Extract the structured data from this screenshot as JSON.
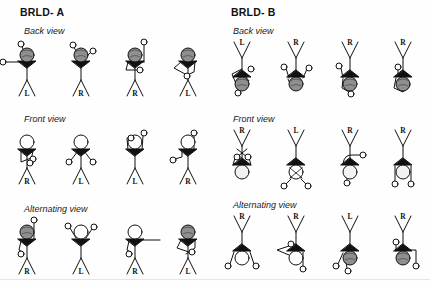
{
  "figure": {
    "background_color": "#ffffff",
    "ink_color": "#111111",
    "head_shaded_color": "#8a8a8a",
    "head_plain_color": "#ffffff"
  },
  "panels": [
    {
      "id": "brld-a",
      "title": "BRLD- A",
      "orientation": "upright",
      "rows": [
        {
          "id": "back-view",
          "label": "Back view",
          "figures": [
            {
              "leg_label": "L",
              "head": "shaded",
              "pose": "left-arm-extended-horizontal"
            },
            {
              "leg_label": "R",
              "head": "shaded",
              "pose": "both-arms-up-bent"
            },
            {
              "leg_label": "R",
              "head": "shaded",
              "pose": "right-arm-up-left-arm-down-bent"
            },
            {
              "leg_label": "L",
              "head": "shaded",
              "pose": "arms-crossed-front"
            }
          ]
        },
        {
          "id": "front-view",
          "label": "Front view",
          "figures": [
            {
              "leg_label": "R",
              "head": "plain",
              "pose": "arms-down-folded"
            },
            {
              "leg_label": "L",
              "head": "plain",
              "pose": "both-arms-out-low"
            },
            {
              "leg_label": "L",
              "head": "plain",
              "pose": "both-arms-raised-overhead"
            },
            {
              "leg_label": "R",
              "head": "plain",
              "pose": "right-arm-up-left-arm-side"
            }
          ]
        },
        {
          "id": "alternating-view",
          "label": "Alternating view",
          "figures": [
            {
              "leg_label": "R",
              "head": "shaded",
              "pose": "one-arm-up-one-arm-down"
            },
            {
              "leg_label": "L",
              "head": "plain",
              "pose": "both-arms-up-bent"
            },
            {
              "leg_label": "R",
              "head": "plain",
              "pose": "arm-extended-horizontal-right"
            },
            {
              "leg_label": "L",
              "head": "shaded",
              "pose": "arms-crossed-front"
            }
          ]
        }
      ]
    },
    {
      "id": "brld-b",
      "title": "BRLD- B",
      "orientation": "inverted",
      "rows": [
        {
          "id": "back-view",
          "label": "Back view",
          "figures": [
            {
              "leg_label": "L",
              "head": "shaded",
              "pose": "arm-loop-left"
            },
            {
              "leg_label": "R",
              "head": "shaded",
              "pose": "both-arms-out"
            },
            {
              "leg_label": "R",
              "head": "shaded",
              "pose": "left-arm-out-bent"
            },
            {
              "leg_label": "R",
              "head": "shaded",
              "pose": "arm-bent-across"
            }
          ]
        },
        {
          "id": "front-view",
          "label": "Front view",
          "figures": [
            {
              "leg_label": "R",
              "head": "plain",
              "pose": "arms-crossed-high"
            },
            {
              "leg_label": "L",
              "head": "plain",
              "pose": "both-arms-down-crossed-head"
            },
            {
              "leg_label": "R",
              "head": "plain",
              "pose": "arm-hooked-right"
            },
            {
              "leg_label": "R",
              "head": "plain",
              "pose": "both-arms-down-open"
            }
          ]
        },
        {
          "id": "alternating-view",
          "label": "Alternating view",
          "figures": [
            {
              "leg_label": "R",
              "head": "plain",
              "pose": "both-arms-out-low"
            },
            {
              "leg_label": "R",
              "head": "plain",
              "pose": "arm-triangle-left"
            },
            {
              "leg_label": "L",
              "head": "shaded",
              "pose": "arm-down-left-bent"
            },
            {
              "leg_label": "R",
              "head": "shaded",
              "pose": "arm-hooked-right-square"
            }
          ]
        }
      ]
    }
  ]
}
